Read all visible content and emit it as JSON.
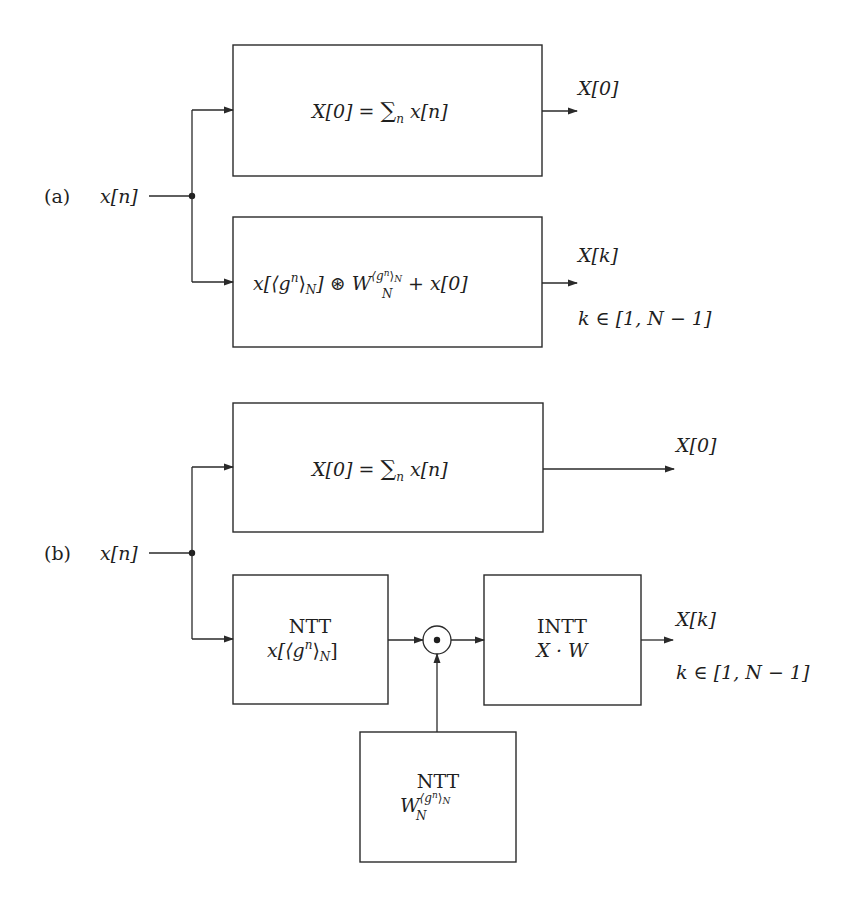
{
  "diagram": {
    "type": "block-diagram",
    "colors": {
      "background": "#ffffff",
      "stroke": "#2a2a2a",
      "text": "#1f1f1f"
    },
    "part_a": {
      "label": "(a)",
      "input": "x[n]",
      "blocks": [
        {
          "id": "a-dc-block",
          "expr_lhs": "X[0] = ",
          "expr_sum": "∑",
          "expr_sum_sub": "n",
          "expr_rhs": " x[n]",
          "output_label": "X[0]"
        },
        {
          "id": "a-conv-block",
          "expr_part1": "x[⟨g",
          "expr_part1_sup": "n",
          "expr_part1_close": "⟩",
          "expr_part1_sub": "N",
          "expr_part1_end": "] ⊛ W",
          "expr_w_sub": "N",
          "expr_w_sup": "⟨g",
          "expr_w_sup_n": "n",
          "expr_w_sup_close": "⟩",
          "expr_w_sup_sub": "N",
          "expr_tail": " + x[0]",
          "output_label": "X[k]",
          "output_range": "k ∈ [1, N − 1]"
        }
      ]
    },
    "part_b": {
      "label": "(b)",
      "input": "x[n]",
      "blocks": [
        {
          "id": "b-dc-block",
          "expr_lhs": "X[0] = ",
          "expr_sum": "∑",
          "expr_sum_sub": "n",
          "expr_rhs": " x[n]",
          "output_label": "X[0]"
        },
        {
          "id": "b-ntt-input-block",
          "title": "NTT",
          "expr_a": "x[⟨g",
          "expr_sup": "n",
          "expr_b": "⟩",
          "expr_sub": "N",
          "expr_c": "]"
        },
        {
          "id": "b-pointwise-mult",
          "symbol": "⊙"
        },
        {
          "id": "b-intt-block",
          "title": "INTT",
          "expr": "X · W",
          "output_label": "X[k]",
          "output_range": "k ∈ [1, N − 1]"
        },
        {
          "id": "b-ntt-twiddle-block",
          "title": "NTT",
          "expr_base": "W",
          "expr_sub": "N",
          "expr_sup": "⟨g",
          "expr_sup_n": "n",
          "expr_sup_close": "⟩",
          "expr_sup_sub": "N"
        }
      ]
    }
  }
}
